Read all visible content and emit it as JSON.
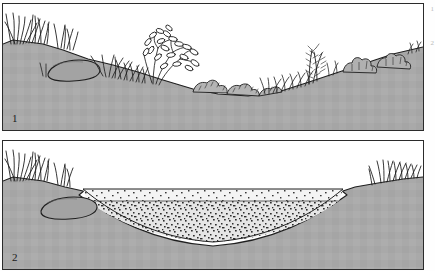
{
  "figure": {
    "background_color": "#ffffff",
    "frame_color": "#2b2b2b"
  },
  "panels": [
    {
      "number": "1",
      "caption": "Existing hollow with grass, shrubs and low plants on natural soil profile",
      "soil_color": "#a9a9a9",
      "outline_color": "#1f1f1f",
      "features": [
        "tall-grass-tuft-left",
        "flat-stone-left",
        "grass-clump",
        "leafy-shrub",
        "low-mounded-plants",
        "upright-shrub-right",
        "broad-leaf-plants-right"
      ]
    },
    {
      "number": "2",
      "caption": "Excavated basin lined with white liner and filled with two gravel layers",
      "soil_color": "#a9a9a9",
      "liner_color": "#ffffff",
      "gravel_upper_color": "#f2f2f2",
      "gravel_lower_color": "#e2e2e2",
      "outline_color": "#1f1f1f",
      "features": [
        "tall-grass-tuft-left",
        "flat-stone-left",
        "excavated-basin",
        "white-liner",
        "coarse-gravel-upper-layer",
        "fine-gravel-lower-layer",
        "grass-tuft-right"
      ]
    }
  ],
  "edge_marks": [
    "1",
    "2"
  ]
}
